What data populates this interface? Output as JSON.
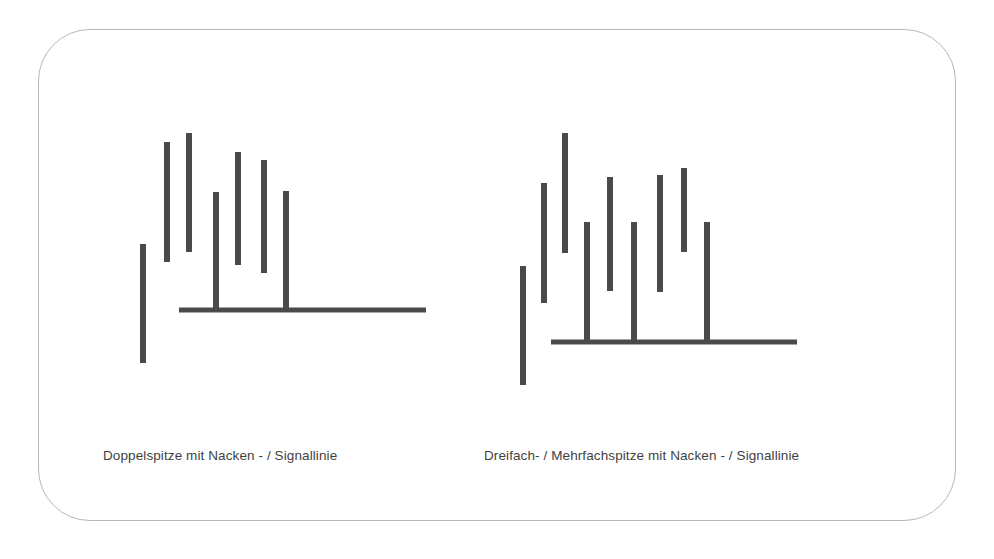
{
  "page": {
    "background_color": "#ffffff",
    "frame": {
      "border_color": "#b7b7b7",
      "corner_radius_px": 52
    }
  },
  "chart_data": [
    {
      "type": "bar",
      "name": "double-top-pattern",
      "title": "Doppelspitze mit Nacken - / Signallinie",
      "ink_color": "#4a4a4a",
      "xlabel": "",
      "ylabel": "",
      "grid": false,
      "legend": null,
      "orientation": "vertical-floating-segments",
      "note": "Stylized price chart: vertical price-range bars forming a double top, plus a horizontal neckline / signal line.",
      "segments": [
        {
          "id": "bar-1",
          "x": 143,
          "top": 244,
          "bottom": 363,
          "width": 6
        },
        {
          "id": "bar-2",
          "x": 167,
          "top": 142,
          "bottom": 262,
          "width": 6
        },
        {
          "id": "bar-3",
          "x": 189,
          "top": 133,
          "bottom": 252,
          "width": 6
        },
        {
          "id": "bar-4",
          "x": 216,
          "top": 192,
          "bottom": 311,
          "width": 6
        },
        {
          "id": "bar-5",
          "x": 238,
          "top": 152,
          "bottom": 265,
          "width": 6
        },
        {
          "id": "bar-6",
          "x": 264,
          "top": 160,
          "bottom": 273,
          "width": 6
        },
        {
          "id": "bar-7",
          "x": 286,
          "top": 191,
          "bottom": 311,
          "width": 6
        }
      ],
      "neckline": {
        "id": "neckline",
        "x1": 179,
        "x2": 426,
        "y": 310,
        "thickness": 5
      }
    },
    {
      "type": "bar",
      "name": "triple-or-multiple-top-pattern",
      "title": "Dreifach- / Mehrfachspitze mit Nacken - / Signallinie",
      "ink_color": "#4a4a4a",
      "xlabel": "",
      "ylabel": "",
      "grid": false,
      "legend": null,
      "orientation": "vertical-floating-segments",
      "note": "Stylized price chart: vertical price-range bars forming a triple / multiple top, plus a horizontal neckline / signal line.",
      "segments": [
        {
          "id": "bar-1",
          "x": 523,
          "top": 266,
          "bottom": 385,
          "width": 6
        },
        {
          "id": "bar-2",
          "x": 544,
          "top": 183,
          "bottom": 303,
          "width": 6
        },
        {
          "id": "bar-3",
          "x": 565,
          "top": 133,
          "bottom": 253,
          "width": 6
        },
        {
          "id": "bar-4",
          "x": 587,
          "top": 222,
          "bottom": 343,
          "width": 6
        },
        {
          "id": "bar-5",
          "x": 610,
          "top": 177,
          "bottom": 291,
          "width": 6
        },
        {
          "id": "bar-6",
          "x": 634,
          "top": 222,
          "bottom": 343,
          "width": 6
        },
        {
          "id": "bar-7",
          "x": 660,
          "top": 175,
          "bottom": 292,
          "width": 6
        },
        {
          "id": "bar-8",
          "x": 684,
          "top": 168,
          "bottom": 252,
          "width": 6
        },
        {
          "id": "bar-9",
          "x": 707,
          "top": 222,
          "bottom": 343,
          "width": 6
        }
      ],
      "neckline": {
        "id": "neckline",
        "x1": 551,
        "x2": 797,
        "y": 342,
        "thickness": 5
      }
    }
  ],
  "captions": {
    "left": "Doppelspitze mit Nacken - / Signallinie",
    "right": "Dreifach- / Mehrfachspitze mit Nacken - / Signallinie"
  }
}
